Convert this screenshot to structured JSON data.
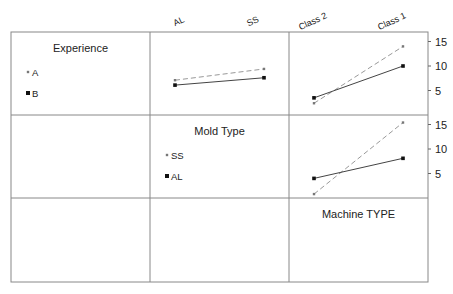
{
  "chart_data": {
    "type": "line",
    "factors": [
      "Experience",
      "Mold Type",
      "Machine TYPE"
    ],
    "column_ticks": {
      "mold_type": [
        "AL",
        "SS"
      ],
      "machine_type": [
        "Class 2",
        "Class 1"
      ]
    },
    "ytick_labels": [
      "15",
      "10",
      "5"
    ],
    "ylim": [
      0,
      17
    ],
    "legends": {
      "experience": {
        "title": "Experience",
        "entries": [
          "A",
          "B"
        ]
      },
      "mold_type": {
        "title": "Mold Type",
        "entries": [
          "SS",
          "AL"
        ]
      },
      "machine_type": {
        "title": "Machine TYPE"
      }
    },
    "panels": [
      {
        "name": "experience-by-mold-type",
        "row": 0,
        "col": 1,
        "categories": [
          "AL",
          "SS"
        ],
        "series": [
          {
            "name": "A",
            "style": "dashed",
            "values": [
              7.1,
              9.4
            ]
          },
          {
            "name": "B",
            "style": "solid",
            "values": [
              6.1,
              7.6
            ]
          }
        ]
      },
      {
        "name": "experience-by-machine-type",
        "row": 0,
        "col": 2,
        "categories": [
          "Class 2",
          "Class 1"
        ],
        "series": [
          {
            "name": "A",
            "style": "dashed",
            "values": [
              2.4,
              14.0
            ]
          },
          {
            "name": "B",
            "style": "solid",
            "values": [
              3.5,
              10.0
            ]
          }
        ]
      },
      {
        "name": "mold-type-by-machine-type",
        "row": 1,
        "col": 2,
        "categories": [
          "Class 2",
          "Class 1"
        ],
        "series": [
          {
            "name": "SS",
            "style": "dashed",
            "values": [
              0.8,
              15.4
            ]
          },
          {
            "name": "AL",
            "style": "solid",
            "values": [
              4.0,
              8.1
            ]
          }
        ]
      }
    ]
  }
}
